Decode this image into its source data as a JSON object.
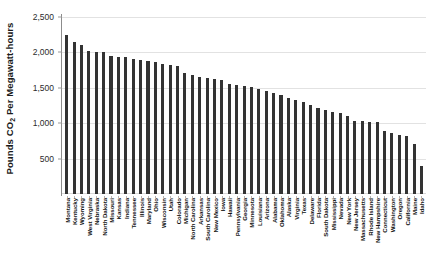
{
  "chart_data": {
    "type": "bar",
    "title": "",
    "subtitle": "",
    "xlabel": "",
    "ylabel": "Pounds CO2 Per Megawatt-hours",
    "ylabel_parts": {
      "prefix": "Pounds CO",
      "sub": "2",
      "suffix": " Per Megawatt-hours"
    },
    "ylim": [
      0,
      2500
    ],
    "ytick_values": [
      500,
      1000,
      1500,
      2000,
      2500
    ],
    "ytick_labels": [
      "500",
      "1,000",
      "1,500",
      "2,000",
      "2,500"
    ],
    "grid": true,
    "grid_axis": "y",
    "legend": "none",
    "bar_color": "#333333",
    "categories": [
      "Montana",
      "Kentucky",
      "Wyoming",
      "West Virginia",
      "Nebraska",
      "North Dakota",
      "Missouri",
      "Kansas",
      "Indiana",
      "Tennessee",
      "Illinois",
      "Maryland",
      "Ohio",
      "Wisconsin",
      "Utah",
      "Colorado",
      "Michigan",
      "North Carolina",
      "Arkansas",
      "South Carolina",
      "New Mexico",
      "Iowa",
      "Hawaii",
      "Pennsylvania",
      "Georgia",
      "Minnesota",
      "Louisiana",
      "Arizona",
      "Alabama",
      "Oklahoma",
      "Alaska",
      "Virginia",
      "Texas",
      "Delaware",
      "Florida",
      "South Dakota",
      "Mississippi",
      "Nevada",
      "New York",
      "New Jersey",
      "Massachusetts",
      "Rhode Island",
      "New Hampshire",
      "Connecticut",
      "Washington",
      "Oregon",
      "California",
      "Maine",
      "Idaho"
    ],
    "values": [
      2245,
      2145,
      2110,
      2015,
      2010,
      2000,
      1950,
      1940,
      1930,
      1905,
      1890,
      1880,
      1865,
      1840,
      1825,
      1810,
      1715,
      1675,
      1650,
      1635,
      1620,
      1605,
      1555,
      1540,
      1525,
      1510,
      1490,
      1450,
      1420,
      1400,
      1350,
      1330,
      1300,
      1260,
      1215,
      1190,
      1165,
      1145,
      1105,
      1035,
      1025,
      1020,
      1015,
      890,
      860,
      840,
      820,
      700,
      390
    ]
  }
}
